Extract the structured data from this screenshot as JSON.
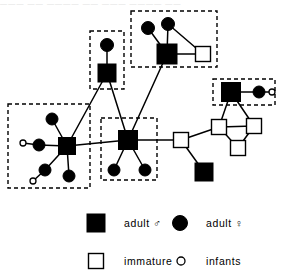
{
  "figure": {
    "width": 292,
    "height": 280,
    "background_color": "#ffffff",
    "ink_color": "#000000",
    "cropped_caption_remnant": "――― ―― ―――― ―― ――― ―――― ――"
  },
  "legend": {
    "items": [
      {
        "key": "adult-male",
        "symbol": "filled-square",
        "label": "adult",
        "sex_glyph": "♂"
      },
      {
        "key": "adult-female",
        "symbol": "filled-circle",
        "label": "adult",
        "sex_glyph": "♀"
      },
      {
        "key": "immature-male",
        "symbol": "open-square",
        "label": "immature",
        "sex_glyph": "♂"
      },
      {
        "key": "infants",
        "symbol": "open-circle",
        "label": "infants",
        "sex_glyph": ""
      }
    ]
  },
  "chart_data": {
    "type": "diagram",
    "subtype": "kinship-social-network",
    "symbol_key": {
      "filled-square": "adult male",
      "filled-circle": "adult female",
      "open-square": "immature male",
      "open-circle": "infant"
    },
    "clusters": [
      {
        "id": "cluster-left",
        "x": 8,
        "y": 104,
        "w": 82,
        "h": 84,
        "members": [
          "L-male",
          "L-f1",
          "L-f2",
          "L-f3",
          "L-f4",
          "L-inf1",
          "L-inf2"
        ]
      },
      {
        "id": "cluster-top-mid",
        "x": 90,
        "y": 31,
        "w": 34,
        "h": 58,
        "members": [
          "TM-female",
          "TM-male"
        ]
      },
      {
        "id": "cluster-top-right",
        "x": 131,
        "y": 11,
        "w": 86,
        "h": 56,
        "members": [
          "TR-male",
          "TR-f1",
          "TR-f2",
          "TR-imm"
        ]
      },
      {
        "id": "cluster-middle",
        "x": 101,
        "y": 118,
        "w": 56,
        "h": 62,
        "members": [
          "M-male",
          "M-f1",
          "M-f2"
        ]
      },
      {
        "id": "cluster-right-top",
        "x": 213,
        "y": 79,
        "w": 62,
        "h": 26,
        "members": [
          "RT-male",
          "RT-female",
          "RT-infant"
        ]
      }
    ],
    "nodes": [
      {
        "id": "L-male",
        "type": "filled-square",
        "x": 67,
        "y": 146,
        "size": 17
      },
      {
        "id": "L-f1",
        "type": "filled-circle",
        "x": 52,
        "y": 119,
        "size": 12
      },
      {
        "id": "L-f2",
        "type": "filled-circle",
        "x": 39,
        "y": 145,
        "size": 12
      },
      {
        "id": "L-f3",
        "type": "filled-circle",
        "x": 45,
        "y": 170,
        "size": 12
      },
      {
        "id": "L-f4",
        "type": "filled-circle",
        "x": 69,
        "y": 176,
        "size": 12
      },
      {
        "id": "L-inf1",
        "type": "open-circle",
        "x": 23,
        "y": 143,
        "size": 6
      },
      {
        "id": "L-inf2",
        "type": "open-circle",
        "x": 33,
        "y": 181,
        "size": 6
      },
      {
        "id": "TM-female",
        "type": "filled-circle",
        "x": 107,
        "y": 45,
        "size": 13
      },
      {
        "id": "TM-male",
        "type": "filled-square",
        "x": 107,
        "y": 73,
        "size": 18
      },
      {
        "id": "TR-male",
        "type": "filled-square",
        "x": 167,
        "y": 54,
        "size": 20
      },
      {
        "id": "TR-f1",
        "type": "filled-circle",
        "x": 148,
        "y": 28,
        "size": 13
      },
      {
        "id": "TR-f2",
        "type": "filled-circle",
        "x": 168,
        "y": 24,
        "size": 13
      },
      {
        "id": "TR-imm",
        "type": "open-square",
        "x": 203,
        "y": 54,
        "size": 15
      },
      {
        "id": "M-male",
        "type": "filled-square",
        "x": 128,
        "y": 140,
        "size": 19
      },
      {
        "id": "M-f1",
        "type": "filled-circle",
        "x": 114,
        "y": 170,
        "size": 12
      },
      {
        "id": "M-f2",
        "type": "filled-circle",
        "x": 145,
        "y": 170,
        "size": 12
      },
      {
        "id": "RT-male",
        "type": "filled-square",
        "x": 231,
        "y": 92,
        "size": 19
      },
      {
        "id": "RT-female",
        "type": "filled-circle",
        "x": 259,
        "y": 92,
        "size": 12
      },
      {
        "id": "RT-infant",
        "type": "open-circle",
        "x": 272,
        "y": 92,
        "size": 6
      },
      {
        "id": "R-imm1",
        "type": "open-square",
        "x": 219,
        "y": 127,
        "size": 15
      },
      {
        "id": "R-imm2",
        "type": "open-square",
        "x": 254,
        "y": 126,
        "size": 15
      },
      {
        "id": "R-imm3",
        "type": "open-square",
        "x": 238,
        "y": 148,
        "size": 15
      },
      {
        "id": "R-imm4",
        "type": "open-square",
        "x": 181,
        "y": 140,
        "size": 15
      },
      {
        "id": "R-male-low",
        "type": "filled-square",
        "x": 204,
        "y": 172,
        "size": 18
      }
    ],
    "edges": [
      {
        "from": "L-f1",
        "to": "L-male"
      },
      {
        "from": "L-f2",
        "to": "L-male"
      },
      {
        "from": "L-f3",
        "to": "L-male"
      },
      {
        "from": "L-f4",
        "to": "L-male"
      },
      {
        "from": "L-inf1",
        "to": "L-f2"
      },
      {
        "from": "L-inf2",
        "to": "L-f3"
      },
      {
        "from": "L-male",
        "to": "M-male"
      },
      {
        "from": "L-male",
        "to": "TM-male"
      },
      {
        "from": "TM-female",
        "to": "TM-male"
      },
      {
        "from": "TM-male",
        "to": "M-male"
      },
      {
        "from": "TR-f1",
        "to": "TR-male"
      },
      {
        "from": "TR-f2",
        "to": "TR-male"
      },
      {
        "from": "TR-f2",
        "to": "TR-imm"
      },
      {
        "from": "TR-male",
        "to": "TR-imm"
      },
      {
        "from": "TR-male",
        "to": "M-male"
      },
      {
        "from": "M-f1",
        "to": "M-male"
      },
      {
        "from": "M-f2",
        "to": "M-male"
      },
      {
        "from": "M-male",
        "to": "R-imm4"
      },
      {
        "from": "RT-male",
        "to": "RT-female"
      },
      {
        "from": "RT-female",
        "to": "RT-infant"
      },
      {
        "from": "RT-male",
        "to": "R-imm1"
      },
      {
        "from": "RT-male",
        "to": "R-imm2"
      },
      {
        "from": "R-imm1",
        "to": "R-imm2"
      },
      {
        "from": "R-imm1",
        "to": "R-imm3"
      },
      {
        "from": "R-imm2",
        "to": "R-imm3"
      },
      {
        "from": "R-imm4",
        "to": "R-imm1"
      },
      {
        "from": "R-imm4",
        "to": "R-male-low"
      }
    ]
  }
}
